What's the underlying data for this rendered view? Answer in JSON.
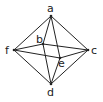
{
  "diagram": {
    "type": "octahedron-graph",
    "vertices": [
      {
        "id": "a",
        "label": "a",
        "x": 51,
        "y": 16,
        "lx": 47,
        "ly": 12
      },
      {
        "id": "b",
        "label": "b",
        "x": 43,
        "y": 44,
        "lx": 36,
        "ly": 43
      },
      {
        "id": "c",
        "label": "c",
        "x": 88,
        "y": 50,
        "lx": 91,
        "ly": 54
      },
      {
        "id": "d",
        "label": "d",
        "x": 51,
        "y": 84,
        "lx": 47,
        "ly": 96
      },
      {
        "id": "e",
        "label": "e",
        "x": 60,
        "y": 58,
        "lx": 58,
        "ly": 67
      },
      {
        "id": "f",
        "label": "f",
        "x": 14,
        "y": 50,
        "lx": 5,
        "ly": 54
      }
    ],
    "edges": [
      [
        "a",
        "f"
      ],
      [
        "a",
        "c"
      ],
      [
        "f",
        "d"
      ],
      [
        "c",
        "d"
      ],
      [
        "a",
        "b"
      ],
      [
        "b",
        "d"
      ],
      [
        "a",
        "e"
      ],
      [
        "e",
        "d"
      ],
      [
        "f",
        "b"
      ],
      [
        "b",
        "c"
      ],
      [
        "f",
        "e"
      ],
      [
        "e",
        "c"
      ]
    ],
    "stroke_color": "#222222"
  }
}
